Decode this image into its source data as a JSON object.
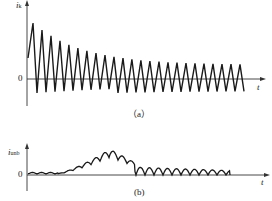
{
  "panel_a": {
    "y_axis_label": "i",
    "y_axis_sub": "k",
    "x_axis_label": "t",
    "origin_label": "0",
    "caption": "（a）",
    "waveform": {
      "type": "decaying-sawtooth",
      "description": "Sawtooth oscillation with decaying amplitude around zero",
      "peaks_count": 24
    }
  },
  "panel_b": {
    "y_axis_label": "i",
    "y_axis_sub": "unb",
    "x_axis_label": "t",
    "origin_label": "0",
    "caption": "(b)",
    "waveform": {
      "type": "ripple-envelope",
      "description": "Small ripple rising to a hump then decaying back to near zero"
    }
  },
  "colors": {
    "line": "#1a1a1a",
    "axis": "#333333",
    "background": "#ffffff"
  }
}
